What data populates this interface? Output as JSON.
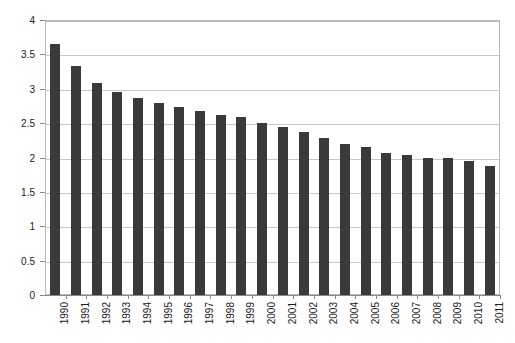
{
  "chart_data": {
    "type": "bar",
    "title": "",
    "subtitle": "",
    "xlabel": "",
    "ylabel": "",
    "categories": [
      "1990",
      "1991",
      "1992",
      "1993",
      "1994",
      "1995",
      "1996",
      "1997",
      "1998",
      "1999",
      "2000",
      "2001",
      "2002",
      "2003",
      "2004",
      "2005",
      "2006",
      "2007",
      "2008",
      "2009",
      "2010",
      "2011"
    ],
    "values": [
      3.65,
      3.33,
      3.08,
      2.95,
      2.87,
      2.8,
      2.73,
      2.67,
      2.62,
      2.59,
      2.5,
      2.44,
      2.37,
      2.28,
      2.19,
      2.15,
      2.07,
      2.04,
      2.0,
      1.99,
      1.95,
      1.88
    ],
    "series": [
      {
        "name": "value",
        "values": [
          3.65,
          3.33,
          3.08,
          2.95,
          2.87,
          2.8,
          2.73,
          2.67,
          2.62,
          2.59,
          2.5,
          2.44,
          2.37,
          2.28,
          2.19,
          2.15,
          2.07,
          2.04,
          2.0,
          1.99,
          1.95,
          1.88
        ]
      }
    ],
    "ylim": [
      0,
      4
    ],
    "yticks": [
      0,
      0.5,
      1,
      1.5,
      2,
      2.5,
      3,
      3.5,
      4
    ],
    "ytick_labels": [
      "0",
      "0.5",
      "1",
      "1.5",
      "2",
      "2.5",
      "3",
      "3.5",
      "4"
    ],
    "grid": true,
    "grid_axis": "y",
    "legend": false,
    "legend_position": "none",
    "bar_color": "#3a3a3a",
    "grid_color": "#c8c8c8",
    "frame_color": "#b9b9b9",
    "background_color": "#ffffff",
    "xtick_rotation": -90
  }
}
